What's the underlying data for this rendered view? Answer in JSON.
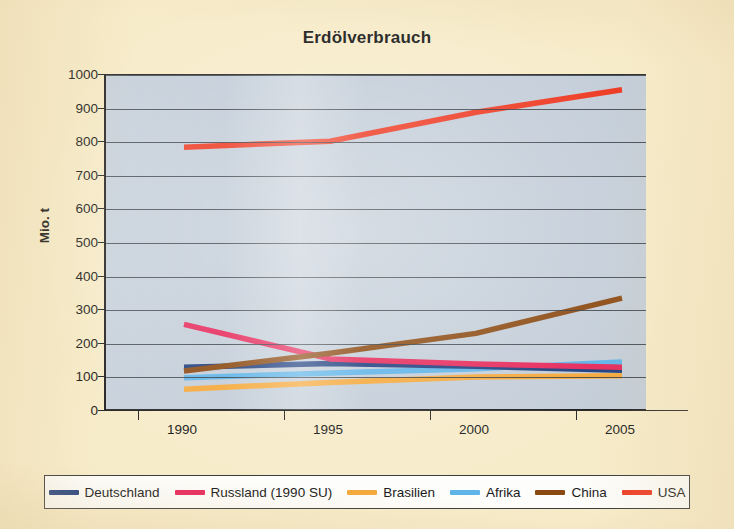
{
  "page": {
    "background_color": "#F7ECCA",
    "plot_background_color": "#C4CED9"
  },
  "chart": {
    "title": "Erdölverbrauch",
    "y_axis_title": "Mio. t"
  },
  "legend": {
    "items": [
      {
        "label": "Deutschland",
        "color": "#1F3F7F"
      },
      {
        "label": "Russland (1990 SU)",
        "color": "#E62A5C"
      },
      {
        "label": "Brasilien",
        "color": "#F5A93C"
      },
      {
        "label": "Afrika",
        "color": "#5FB4E8"
      },
      {
        "label": "China",
        "color": "#8B4A12"
      },
      {
        "label": "USA",
        "color": "#EE3B24"
      }
    ]
  },
  "chart_data": {
    "type": "line",
    "title": "Erdölverbrauch",
    "xlabel": "",
    "ylabel": "Mio. t",
    "x": [
      1990,
      1995,
      2000,
      2005
    ],
    "xtick_labels": [
      "1990",
      "1995",
      "2000",
      "2005"
    ],
    "ytick_labels": [
      "0",
      "100",
      "200",
      "300",
      "400",
      "500",
      "600",
      "700",
      "800",
      "900",
      "1000"
    ],
    "yticks": [
      0,
      100,
      200,
      300,
      400,
      500,
      600,
      700,
      800,
      900,
      1000
    ],
    "ylim": [
      0,
      1000
    ],
    "xlim": [
      1990,
      2005
    ],
    "grid": true,
    "legend_position": "bottom",
    "series": [
      {
        "name": "Deutschland",
        "color": "#1F3F7F",
        "values": [
          130,
          141,
          133,
          121
        ]
      },
      {
        "name": "Russland (1990 SU)",
        "color": "#E62A5C",
        "values": [
          258,
          155,
          140,
          130
        ]
      },
      {
        "name": "Brasilien",
        "color": "#F5A93C",
        "values": [
          65,
          85,
          101,
          105
        ]
      },
      {
        "name": "Afrika",
        "color": "#5FB4E8",
        "values": [
          99,
          113,
          126,
          146
        ]
      },
      {
        "name": "China",
        "color": "#8B4A12",
        "values": [
          119,
          172,
          231,
          336
        ]
      },
      {
        "name": "USA",
        "color": "#EE3B24",
        "values": [
          785,
          803,
          889,
          956
        ]
      }
    ]
  }
}
